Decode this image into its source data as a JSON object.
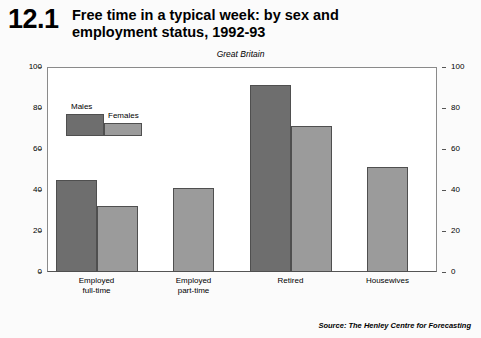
{
  "figure": {
    "number": "12.1",
    "title": "Free time in a typical week: by sex and employment status, 1992-93",
    "subtitle": "Great Britain",
    "units": "Hours",
    "source": "Source: The Henley Centre for Forecasting"
  },
  "legend": {
    "males": "Males",
    "females": "Females"
  },
  "colors": {
    "male_bar": "#6e6e6e",
    "female_bar": "#9b9b9b",
    "bar_border": "#4f4f4f",
    "axis": "#555555",
    "background": "#fbfbfb"
  },
  "axis": {
    "ticks": [
      "0",
      "20",
      "40",
      "60",
      "80",
      "100"
    ],
    "left_labels": [
      "100",
      "80",
      "60",
      "40",
      "20",
      "0"
    ],
    "right_labels": [
      "100",
      "80",
      "60",
      "40",
      "20",
      "0"
    ]
  },
  "categories": [
    {
      "line1": "Employed",
      "line2": "full-time"
    },
    {
      "line1": "Employed",
      "line2": "part-time"
    },
    {
      "line1": "Retired",
      "line2": ""
    },
    {
      "line1": "Housewives",
      "line2": ""
    }
  ],
  "chart_data": {
    "type": "bar",
    "title": "Free time in a typical week: by sex and employment status, 1992-93",
    "subtitle": "Great Britain",
    "xlabel": "",
    "ylabel": "Hours",
    "ylim": [
      0,
      100
    ],
    "yticks": [
      0,
      20,
      40,
      60,
      80,
      100
    ],
    "grid": false,
    "legend_position": "inside-top-left",
    "categories": [
      "Employed full-time",
      "Employed part-time",
      "Retired",
      "Housewives"
    ],
    "series": [
      {
        "name": "Males",
        "values": [
          45,
          null,
          91,
          null
        ]
      },
      {
        "name": "Females",
        "values": [
          32,
          41,
          71,
          51
        ]
      }
    ],
    "annotations": [
      "Source: The Henley Centre for Forecasting"
    ]
  }
}
